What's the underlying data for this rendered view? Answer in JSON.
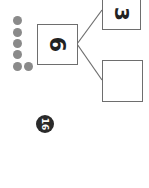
{
  "worksheet": {
    "problem_number": "16",
    "number_bond": {
      "whole": "6",
      "part_one": "3",
      "part_two": ""
    },
    "dots": {
      "count": 6,
      "color": "#8a8a8a"
    },
    "orientation": "rotated 90deg clockwise"
  }
}
